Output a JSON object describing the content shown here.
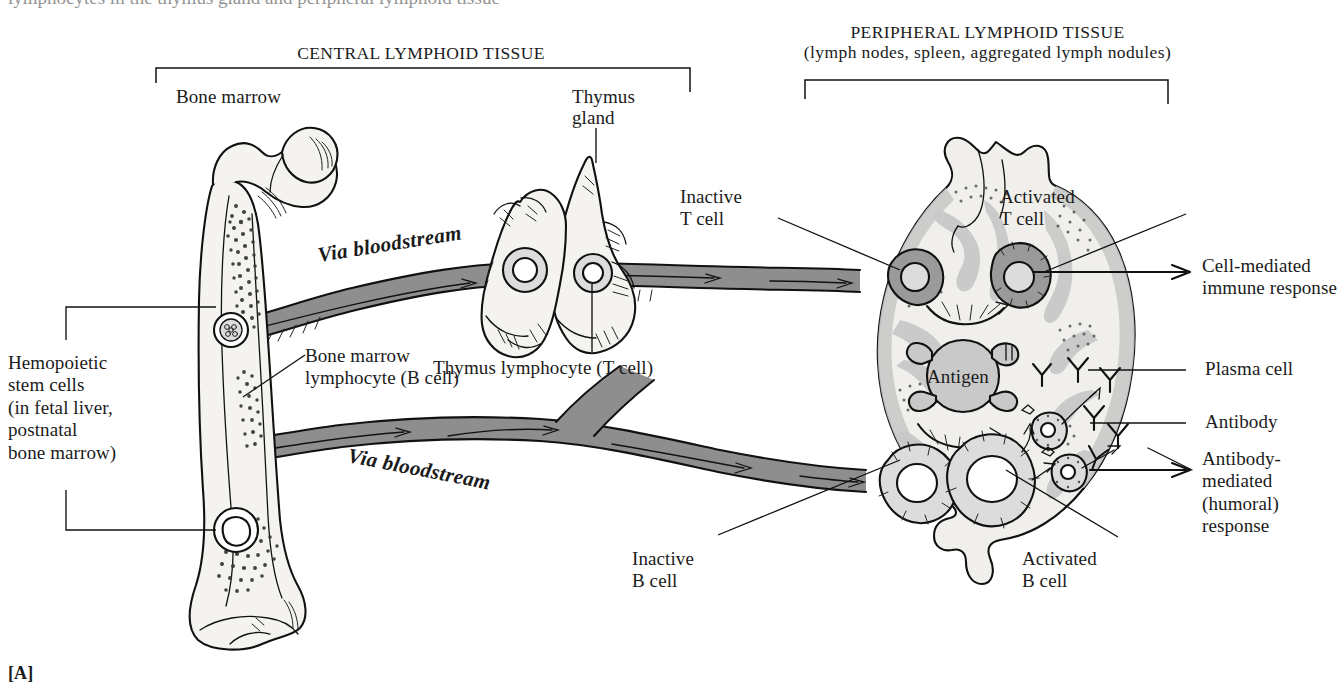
{
  "figure": {
    "panel_marker": "[A]",
    "top_cut_text": "lymphocytes in the thymus gland and peripheral lymphoid tissue",
    "headings": {
      "central": "CENTRAL LYMPHOID TISSUE",
      "peripheral_line1": "PERIPHERAL LYMPHOID TISSUE",
      "peripheral_line2": "(lymph nodes, spleen, aggregated lymph nodules)"
    },
    "organs": {
      "bone_marrow": "Bone marrow",
      "thymus_line1": "Thymus",
      "thymus_line2": "gland"
    },
    "labels": {
      "hemopoietic": "Hemopoietic\nstem cells\n(in fetal liver,\npostnatal\nbone marrow)",
      "b_lymphocyte": "Bone marrow\nlymphocyte (B cell)",
      "t_lymphocyte": "Thymus lymphocyte (T cell)",
      "via_bloodstream_upper": "Via bloodstream",
      "via_bloodstream_lower": "Via bloodstream",
      "inactive_t": "Inactive\nT cell",
      "activated_t": "Activated\nT cell",
      "inactive_b": "Inactive\nB cell",
      "activated_b": "Activated\nB cell",
      "antigen": "Antigen",
      "plasma_cell": "Plasma cell",
      "antibody": "Antibody",
      "cell_mediated": "Cell-mediated\nimmune response",
      "antibody_mediated": "Antibody-\nmediated\n(humoral)\nresponse"
    },
    "colors": {
      "ink": "#111111",
      "paper": "#ffffff",
      "vessel_gray": "#8e8e8e",
      "tissue_gray": "#c9c9c9",
      "bone_fill": "#f4f3f0",
      "node_fill": "#f0efec"
    }
  }
}
